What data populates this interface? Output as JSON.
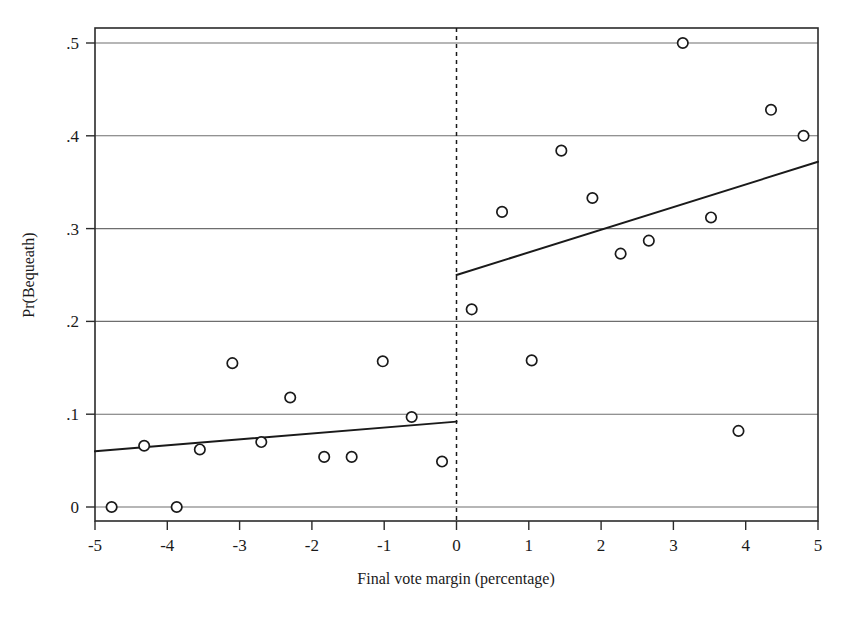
{
  "chart_data": {
    "type": "scatter",
    "title": "",
    "subtitle": "",
    "xlabel": "Final vote margin (percentage)",
    "ylabel": "Pr(Bequeath)",
    "xlim": [
      -5,
      5
    ],
    "ylim": [
      0,
      0.51
    ],
    "xticks": [
      -5,
      -4,
      -3,
      -2,
      -1,
      0,
      1,
      2,
      3,
      4,
      5
    ],
    "xticklabels": [
      "-5",
      "-4",
      "-3",
      "-2",
      "-1",
      "0",
      "1",
      "2",
      "3",
      "4",
      "5"
    ],
    "yticks": [
      0,
      0.1,
      0.2,
      0.3,
      0.4,
      0.5
    ],
    "yticklabels": [
      "0",
      ".1",
      ".2",
      ".3",
      ".4",
      ".5"
    ],
    "grid": "horizontal",
    "legend": "none",
    "marker": "open-circle",
    "cutoff_line": {
      "x": 0,
      "style": "dashed",
      "label": ""
    },
    "points": [
      {
        "x": -4.77,
        "y": 0.0
      },
      {
        "x": -4.32,
        "y": 0.066
      },
      {
        "x": -3.87,
        "y": 0.0
      },
      {
        "x": -3.55,
        "y": 0.062
      },
      {
        "x": -3.1,
        "y": 0.155
      },
      {
        "x": -2.7,
        "y": 0.07
      },
      {
        "x": -2.3,
        "y": 0.118
      },
      {
        "x": -1.83,
        "y": 0.054
      },
      {
        "x": -1.45,
        "y": 0.054
      },
      {
        "x": -1.02,
        "y": 0.157
      },
      {
        "x": -0.62,
        "y": 0.097
      },
      {
        "x": -0.2,
        "y": 0.049
      },
      {
        "x": 0.21,
        "y": 0.213
      },
      {
        "x": 0.63,
        "y": 0.318
      },
      {
        "x": 1.04,
        "y": 0.158
      },
      {
        "x": 1.45,
        "y": 0.384
      },
      {
        "x": 1.88,
        "y": 0.333
      },
      {
        "x": 2.27,
        "y": 0.273
      },
      {
        "x": 2.66,
        "y": 0.287
      },
      {
        "x": 3.13,
        "y": 0.5
      },
      {
        "x": 3.52,
        "y": 0.312
      },
      {
        "x": 3.9,
        "y": 0.082
      },
      {
        "x": 4.35,
        "y": 0.428
      },
      {
        "x": 4.8,
        "y": 0.4
      }
    ],
    "fit_lines": [
      {
        "name": "left-of-cutoff-fit",
        "x0": -5.0,
        "y0": 0.06,
        "x1": 0.0,
        "y1": 0.092
      },
      {
        "name": "right-of-cutoff-fit",
        "x0": 0.0,
        "y0": 0.25,
        "x1": 5.0,
        "y1": 0.372
      }
    ]
  }
}
